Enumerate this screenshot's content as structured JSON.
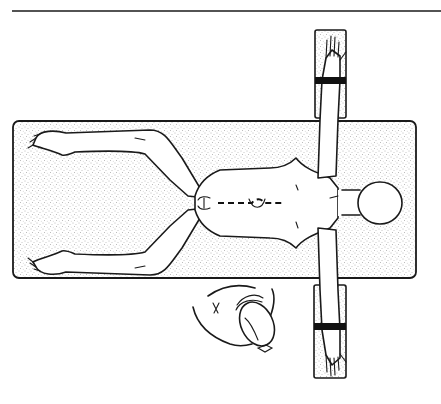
{
  "figure": {
    "colors": {
      "line": "#1a1a1a",
      "background": "#ffffff",
      "stipple": "#8a8a8a",
      "strap": "#111111"
    },
    "elements": {
      "rule_line": "top-rule",
      "table": "operating-table",
      "arm_board_top": "arm-board-upper",
      "arm_board_bottom": "arm-board-lower",
      "straps": 2,
      "incision": "dashed-midline-incision",
      "surgeon": "surgeon-top-view"
    }
  }
}
